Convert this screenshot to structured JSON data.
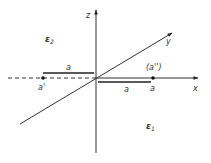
{
  "axes": {
    "z_label": "z",
    "y_label": "y",
    "x_label": "x"
  },
  "points": {
    "a_prime": "a'",
    "a": "a",
    "a_double_prime": "(a'')"
  },
  "distances": {
    "upper_a": "a",
    "lower_a": "a"
  },
  "regions": {
    "epsilon_2": "ε",
    "epsilon_2_sub": "2",
    "epsilon_1": "ε",
    "epsilon_1_sub": "1"
  },
  "colors": {
    "line": "#333333",
    "background": "#ffffff"
  }
}
